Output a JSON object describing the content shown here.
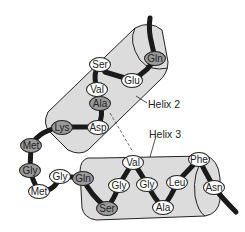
{
  "diagram": {
    "type": "protein helix-turn-helix structure",
    "colors": {
      "cylinder_fill": "#dcdcdc",
      "backbone": "#1a1a1a",
      "residue_light": "#ffffff",
      "residue_dark": "#9a9a9a",
      "outline": "#222222"
    },
    "labels": [
      {
        "id": "helix2",
        "text": "Helix 2",
        "x": 148,
        "y": 98
      },
      {
        "id": "helix3",
        "text": "Helix 3",
        "x": 149,
        "y": 128
      }
    ],
    "residues": [
      {
        "text": "Ser",
        "cx": 100,
        "cy": 64,
        "shade": "light"
      },
      {
        "text": "Gln",
        "cx": 155,
        "cy": 58,
        "shade": "dark"
      },
      {
        "text": "Glu",
        "cx": 132,
        "cy": 80,
        "shade": "light"
      },
      {
        "text": "Val",
        "cx": 97,
        "cy": 89,
        "shade": "light"
      },
      {
        "text": "Ala",
        "cx": 100,
        "cy": 103,
        "shade": "dark"
      },
      {
        "text": "Lys",
        "cx": 62,
        "cy": 127,
        "shade": "dark"
      },
      {
        "text": "Asp",
        "cx": 98,
        "cy": 127,
        "shade": "light"
      },
      {
        "text": "Met",
        "cx": 31,
        "cy": 145,
        "shade": "dark"
      },
      {
        "text": "Gly",
        "cx": 30,
        "cy": 170,
        "shade": "dark"
      },
      {
        "text": "Gly",
        "cx": 60,
        "cy": 176,
        "shade": "light"
      },
      {
        "text": "Gln",
        "cx": 83,
        "cy": 178,
        "shade": "dark"
      },
      {
        "text": "Met",
        "cx": 39,
        "cy": 191,
        "shade": "light"
      },
      {
        "text": "Ser",
        "cx": 107,
        "cy": 208,
        "shade": "dark"
      },
      {
        "text": "Val",
        "cx": 133,
        "cy": 162,
        "shade": "light"
      },
      {
        "text": "Gly",
        "cx": 119,
        "cy": 185,
        "shade": "light"
      },
      {
        "text": "Gly",
        "cx": 147,
        "cy": 184,
        "shade": "light"
      },
      {
        "text": "Leu",
        "cx": 177,
        "cy": 182,
        "shade": "light"
      },
      {
        "text": "Phe",
        "cx": 199,
        "cy": 159,
        "shade": "light"
      },
      {
        "text": "Asn",
        "cx": 214,
        "cy": 187,
        "shade": "light"
      },
      {
        "text": "Ala",
        "cx": 163,
        "cy": 207,
        "shade": "light"
      }
    ]
  }
}
